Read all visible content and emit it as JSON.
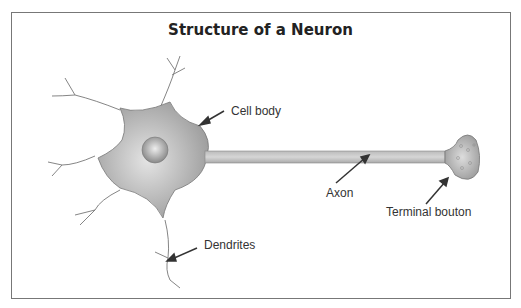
{
  "title": "Structure of a Neuron",
  "labels": {
    "cell_body": "Cell body",
    "axon": "Axon",
    "terminal_bouton": "Terminal bouton",
    "dendrites": "Dendrites"
  }
}
